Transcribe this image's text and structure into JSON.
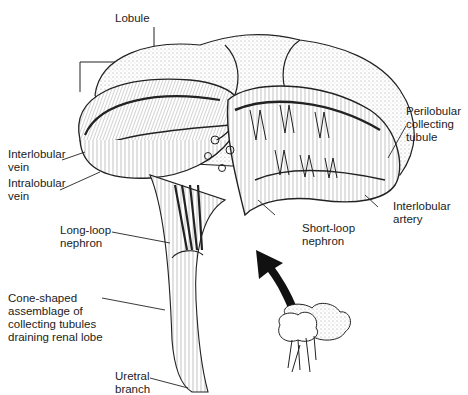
{
  "figure": {
    "labels": {
      "lobule": "Lobule",
      "interlobular_vein": "Interlobular\nvein",
      "intralobular_vein": "Intralobular\nvein",
      "perilobular_collecting_tubule": "Perilobular\ncollecting\ntubule",
      "interlobular_artery": "Interlobular\nartery",
      "long_loop_nephron": "Long-loop\nnephron",
      "short_loop_nephron": "Short-loop\nnephron",
      "cone_shaped_assemblage": "Cone-shaped\nassemblage of\ncollecting tubules\ndraining renal lobe",
      "uretral_branch": "Uretral\nbranch"
    },
    "colors": {
      "ink": "#1a1a1a",
      "stipple": "#bdbdbd",
      "background": "#ffffff"
    }
  }
}
